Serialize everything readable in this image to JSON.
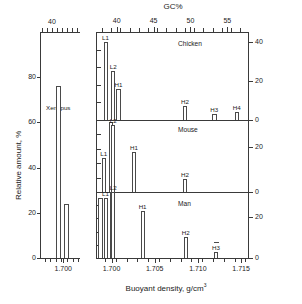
{
  "figure": {
    "top_axis_title": "GC%",
    "x_axis_title_main": "Buoyant density, g/cm",
    "x_axis_title_sup": "3",
    "y_axis_title": "Relative amount, %"
  },
  "left_panel": {
    "name": "Xenopus",
    "species_label": "Xenopus",
    "gc_ticks": [
      "40"
    ],
    "density_ticks": [
      "1.700"
    ],
    "y_ticks": [
      "0",
      "20",
      "40",
      "60",
      "80"
    ]
  },
  "right_panel": {
    "gc_ticks": [
      "40",
      "45",
      "50",
      "55"
    ],
    "density_ticks": [
      "1.700",
      "1.705",
      "1.710",
      "1.715"
    ],
    "sub_panels": [
      "Chicken",
      "Mouse",
      "Man"
    ],
    "chicken_y_ticks": [
      "0",
      "20",
      "40"
    ],
    "mouse_y_ticks": [
      "0",
      "20"
    ],
    "man_y_ticks": [
      "0",
      "20"
    ]
  },
  "chart_data": {
    "type": "bar",
    "xlabel": "Buoyant density, g/cm3",
    "ylabel": "Relative amount, %",
    "secondary_xlabel": "GC%",
    "panels": [
      {
        "name": "Xenopus",
        "ylim": [
          0,
          100
        ],
        "yticks": [
          0,
          20,
          40,
          60,
          80
        ],
        "xlim": [
          1.6975,
          1.7018
        ],
        "xticks": [
          1.7
        ],
        "gcticks": [
          40
        ],
        "peaks": [
          {
            "label": "",
            "density": 1.6995,
            "value": 76
          },
          {
            "label": "",
            "density": 1.7003,
            "value": 24
          }
        ]
      },
      {
        "name": "Chicken",
        "ylim": [
          0,
          45
        ],
        "yticks": [
          0,
          20,
          40
        ],
        "xlim": [
          1.6982,
          1.7158
        ],
        "xticks": [
          1.7,
          1.705,
          1.71,
          1.715
        ],
        "gcticks": [
          40,
          45,
          50,
          55
        ],
        "peaks": [
          {
            "label": "L1",
            "density": 1.6993,
            "value": 40
          },
          {
            "label": "L2",
            "density": 1.7002,
            "value": 25
          },
          {
            "label": "H1",
            "density": 1.7008,
            "value": 16
          },
          {
            "label": "H2",
            "density": 1.7085,
            "value": 7
          },
          {
            "label": "H3",
            "density": 1.7119,
            "value": 3
          },
          {
            "label": "H4",
            "density": 1.7145,
            "value": 4
          }
        ]
      },
      {
        "name": "Mouse",
        "ylim": [
          0,
          32
        ],
        "yticks": [
          0,
          20
        ],
        "xlim": [
          1.6982,
          1.7158
        ],
        "xticks": [
          1.7,
          1.705,
          1.71,
          1.715
        ],
        "peaks": [
          {
            "label": "L1",
            "density": 1.6991,
            "value": 15
          },
          {
            "label": "",
            "density": 1.6999,
            "value": 31
          },
          {
            "label": "L2",
            "density": 1.7002,
            "value": 30
          },
          {
            "label": "H1",
            "density": 1.7026,
            "value": 18
          },
          {
            "label": "H2",
            "density": 1.7085,
            "value": 6
          }
        ]
      },
      {
        "name": "Man",
        "ylim": [
          0,
          32
        ],
        "yticks": [
          0,
          20
        ],
        "xlim": [
          1.6982,
          1.7158
        ],
        "xticks": [
          1.7,
          1.705,
          1.71,
          1.715
        ],
        "peaks": [
          {
            "label": "",
            "density": 1.6987,
            "value": 29
          },
          {
            "label": "L1",
            "density": 1.6993,
            "value": 29
          },
          {
            "label": "",
            "density": 1.7,
            "value": 32
          },
          {
            "label": "L2",
            "density": 1.7002,
            "value": 32
          },
          {
            "label": "H1",
            "density": 1.7036,
            "value": 23
          },
          {
            "label": "H2",
            "density": 1.7086,
            "value": 10
          },
          {
            "label": "H3",
            "density": 1.7121,
            "value": 3
          }
        ]
      }
    ]
  }
}
